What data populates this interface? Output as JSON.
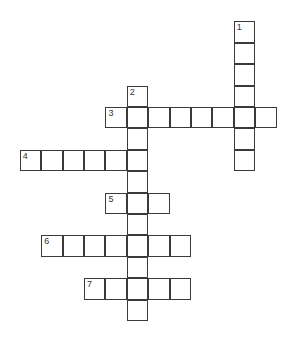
{
  "puzzle": {
    "type": "crossword",
    "cell_size_px": 21.4,
    "origin": {
      "x": 19.8,
      "y": 21.3
    },
    "words": [
      {
        "number": "1",
        "direction": "down",
        "col": 10,
        "row": 0,
        "length": 7
      },
      {
        "number": "2",
        "direction": "down",
        "col": 5,
        "row": 3,
        "length": 11
      },
      {
        "number": "3",
        "direction": "across",
        "col": 4,
        "row": 4,
        "length": 8
      },
      {
        "number": "4",
        "direction": "across",
        "col": 0,
        "row": 6,
        "length": 6
      },
      {
        "number": "5",
        "direction": "across",
        "col": 4,
        "row": 8,
        "length": 3
      },
      {
        "number": "6",
        "direction": "across",
        "col": 1,
        "row": 10,
        "length": 7
      },
      {
        "number": "7",
        "direction": "across",
        "col": 3,
        "row": 12,
        "length": 5
      }
    ]
  }
}
